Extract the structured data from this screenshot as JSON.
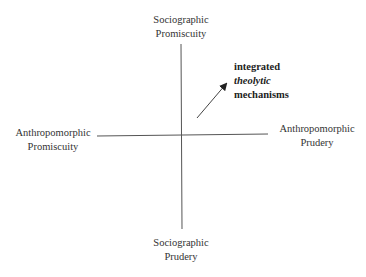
{
  "diagram": {
    "axes": {
      "top": {
        "line1": "Sociographic",
        "line2": "Promiscuity"
      },
      "bottom": {
        "line1": "Sociographic",
        "line2": "Prudery"
      },
      "left": {
        "line1": "Anthropomorphic",
        "line2": "Promiscuity"
      },
      "right": {
        "line1": "Anthropomorphic",
        "line2": "Prudery"
      }
    },
    "annotation": {
      "line1": "integrated",
      "line2": "theolytic",
      "line3": "mechanisms"
    },
    "colors": {
      "line": "#555555",
      "arrow": "#333333"
    }
  }
}
